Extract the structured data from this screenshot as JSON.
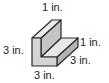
{
  "figure": {
    "colors": {
      "front": "#d4d4d4",
      "top": "#ececec",
      "side": "#b4b4b4",
      "edge": "#2a2a2a"
    }
  },
  "labels": {
    "top": "1 in.",
    "left": "3 in.",
    "right_upper": "1 in.",
    "right_lower": "3 in.",
    "bottom": "3 in."
  }
}
